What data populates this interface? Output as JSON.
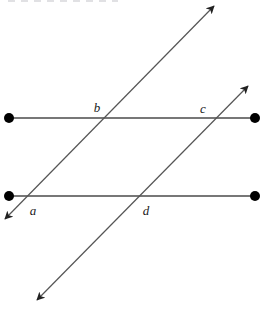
{
  "figure": {
    "width": 264,
    "height": 309,
    "background_color": "#ffffff",
    "line_color": "#4a4a4a",
    "transversal_color": "#555555",
    "dot_color": "#000000",
    "label_color": "#1a1a1a"
  },
  "horizontal_lines": [
    {
      "id": "upper-parallel-line",
      "x1": 9,
      "y1": 118,
      "x2": 255,
      "y2": 118,
      "endpoint_style": "filled-dot",
      "stroke_width": 1.4
    },
    {
      "id": "lower-parallel-line",
      "x1": 9,
      "y1": 196,
      "x2": 255,
      "y2": 196,
      "endpoint_style": "filled-dot",
      "stroke_width": 1.4
    }
  ],
  "endpoint_dots": [
    {
      "id": "upper-left-dot",
      "cx": 9,
      "cy": 118,
      "r": 5
    },
    {
      "id": "upper-right-dot",
      "cx": 255,
      "cy": 118,
      "r": 5
    },
    {
      "id": "lower-left-dot",
      "cx": 9,
      "cy": 196,
      "r": 5
    },
    {
      "id": "lower-right-dot",
      "cx": 255,
      "cy": 196,
      "r": 5
    }
  ],
  "transversals": [
    {
      "id": "transversal-left",
      "x1": 5,
      "y1": 219,
      "x2": 214,
      "y2": 6,
      "arrow_start": true,
      "arrow_end": true,
      "stroke_width": 1.2
    },
    {
      "id": "transversal-right",
      "x1": 37,
      "y1": 300,
      "x2": 248,
      "y2": 86,
      "arrow_start": true,
      "arrow_end": true,
      "stroke_width": 1.2
    }
  ],
  "labels": [
    {
      "id": "label-a",
      "text": "a",
      "x": 33,
      "y": 215,
      "anchor": "middle"
    },
    {
      "id": "label-b",
      "text": "b",
      "x": 97,
      "y": 112,
      "anchor": "middle"
    },
    {
      "id": "label-c",
      "text": "c",
      "x": 203,
      "y": 113,
      "anchor": "middle"
    },
    {
      "id": "label-d",
      "text": "d",
      "x": 146,
      "y": 215,
      "anchor": "middle"
    }
  ],
  "intersections": [
    {
      "id": "intersection-a",
      "label": "a",
      "x": 25,
      "y": 196,
      "lines": [
        "lower-parallel-line",
        "transversal-left"
      ]
    },
    {
      "id": "intersection-b",
      "label": "b",
      "x": 105,
      "y": 118,
      "lines": [
        "upper-parallel-line",
        "transversal-left"
      ]
    },
    {
      "id": "intersection-c",
      "label": "c",
      "x": 214,
      "y": 118,
      "lines": [
        "upper-parallel-line",
        "transversal-right"
      ]
    },
    {
      "id": "intersection-d",
      "label": "d",
      "x": 138,
      "y": 196,
      "lines": [
        "lower-parallel-line",
        "transversal-right"
      ]
    }
  ]
}
